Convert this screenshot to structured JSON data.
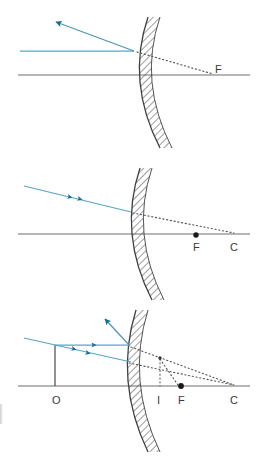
{
  "figure": {
    "background_color": "#ffffff",
    "width": 257,
    "height": 467
  },
  "colors": {
    "ray": "#4a9cc0",
    "ray_dark": "#0f6a85",
    "arrowhead": "#14718f",
    "axis": "#6e6e6e",
    "mirror": "#4a4a4a",
    "hatch": "#555555",
    "dotted": "#555555",
    "label": "#3a3a3a",
    "object": "#3a3a3a"
  },
  "panels": [
    {
      "id": "panel-1",
      "name": "parallel-ray-reflection",
      "axis": {
        "y": 75,
        "x1": 18,
        "x2": 250
      },
      "mirror": {
        "vertex_x": 139,
        "top": {
          "x": 148,
          "y": 17
        },
        "bottom": {
          "x": 160,
          "y": 148
        },
        "bulge": -22
      },
      "incident_ray": {
        "from": {
          "x": 20,
          "y": 51
        },
        "to": {
          "x": 133,
          "y": 51
        },
        "label": "incident parallel ray"
      },
      "reflected_ray": {
        "from": {
          "x": 133,
          "y": 51
        },
        "to": {
          "x": 54,
          "y": 21
        },
        "label": "reflected ray"
      },
      "dotted_ray": {
        "from": {
          "x": 136,
          "y": 52
        },
        "to": {
          "x": 212,
          "y": 74
        },
        "label": "virtual extension to focus"
      },
      "points": [
        {
          "label": "F",
          "x": 218,
          "y": 72,
          "dot": false,
          "name": "focal-point"
        }
      ]
    },
    {
      "id": "panel-2",
      "name": "ray-toward-center-of-curvature",
      "axis": {
        "y": 234,
        "x1": 18,
        "x2": 250
      },
      "mirror": {
        "vertex_x": 130,
        "top": {
          "x": 140,
          "y": 168
        },
        "bottom": {
          "x": 152,
          "y": 300
        },
        "bulge": -22
      },
      "incident_ray": {
        "from": {
          "x": 24,
          "y": 186
        },
        "to": {
          "x": 130,
          "y": 212
        },
        "label": "incident ray aimed at C"
      },
      "dotted_ray": {
        "from": {
          "x": 132,
          "y": 213
        },
        "to": {
          "x": 232,
          "y": 233
        },
        "label": "virtual extension to C"
      },
      "points": [
        {
          "label": "F",
          "x": 196,
          "y": 250,
          "dot": true,
          "name": "focal-point"
        },
        {
          "label": "C",
          "x": 233,
          "y": 250,
          "dot": false,
          "name": "center-of-curvature"
        }
      ]
    },
    {
      "id": "panel-3",
      "name": "image-formation-construction",
      "axis": {
        "y": 386,
        "x1": 18,
        "x2": 250
      },
      "mirror": {
        "vertex_x": 126,
        "top": {
          "x": 136,
          "y": 310
        },
        "bottom": {
          "x": 148,
          "y": 452
        },
        "bulge": -22
      },
      "object": {
        "x": 55,
        "y_top": 345,
        "y_base": 386,
        "label": "O"
      },
      "incident_ray_parallel": {
        "from": {
          "x": 55,
          "y": 345
        },
        "to": {
          "x": 128,
          "y": 345
        },
        "label": "parallel ray"
      },
      "incident_ray_center": {
        "from": {
          "x": 24,
          "y": 338
        },
        "to": {
          "x": 130,
          "y": 361
        },
        "label": "ray toward C"
      },
      "reflected_ray": {
        "from": {
          "x": 128,
          "y": 345
        },
        "to": {
          "x": 103,
          "y": 318
        },
        "label": "reflected ray"
      },
      "dotted_rays": [
        {
          "from": {
            "x": 130,
            "y": 346
          },
          "to": {
            "x": 233,
            "y": 385
          },
          "label": "extension of parallel ray to F"
        },
        {
          "from": {
            "x": 128,
            "y": 362
          },
          "to": {
            "x": 233,
            "y": 385
          },
          "label": "extension toward C"
        },
        {
          "from": {
            "x": 160,
            "y": 358
          },
          "to": {
            "x": 178,
            "y": 385
          },
          "label": "extension to axis at F"
        }
      ],
      "image": {
        "x": 160,
        "y_top": 358,
        "y_base": 385,
        "label": "I"
      },
      "points": [
        {
          "label": "O",
          "x": 55,
          "y": 403,
          "dot": false,
          "name": "object-point"
        },
        {
          "label": "I",
          "x": 160,
          "y": 403,
          "dot": false,
          "name": "image-point"
        },
        {
          "label": "F",
          "x": 181,
          "y": 403,
          "dot": true,
          "name": "focal-point"
        },
        {
          "label": "C",
          "x": 233,
          "y": 403,
          "dot": false,
          "name": "center-of-curvature"
        }
      ]
    }
  ]
}
